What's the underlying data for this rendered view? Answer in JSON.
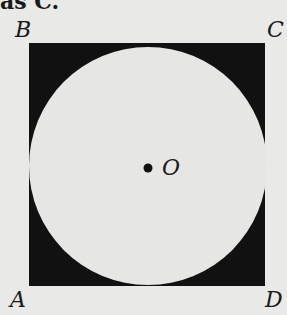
{
  "fragment_text": "as C.",
  "figure": {
    "type": "square-with-inscribed-circle",
    "vertices": {
      "B": "B",
      "C": "C",
      "A": "A",
      "D": "D"
    },
    "center_label": "O",
    "colors": {
      "square_fill": "#111111",
      "circle_fill": "#e6e6e4",
      "background": "#e9e9e7"
    }
  }
}
